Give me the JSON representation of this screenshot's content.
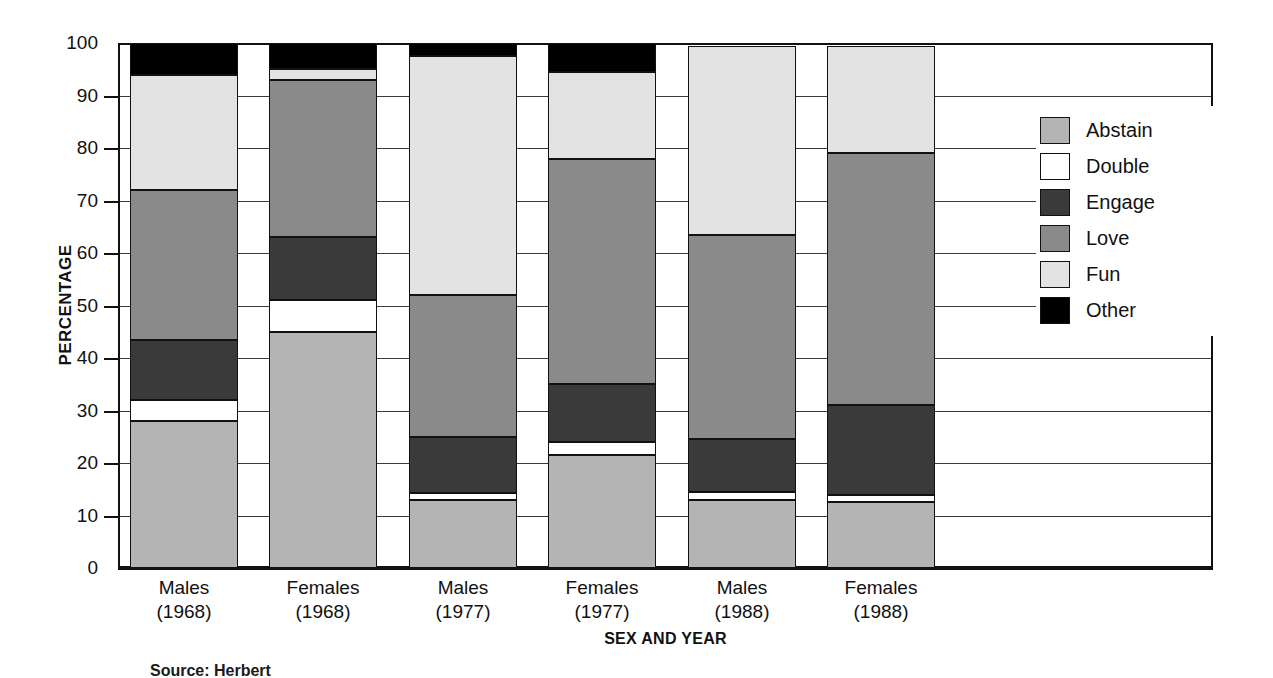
{
  "chart_data": {
    "type": "bar",
    "subtype": "stacked-bar-100",
    "title": "",
    "xlabel": "SEX AND YEAR",
    "ylabel": "PERCENTAGE",
    "ylim": [
      0,
      100
    ],
    "yticks": [
      "0",
      "10",
      "20",
      "30",
      "40",
      "50",
      "60",
      "70",
      "80",
      "90",
      "100"
    ],
    "grid": true,
    "legend_position": "right",
    "categories": [
      "Males (1968)",
      "Females (1968)",
      "Males (1977)",
      "Females (1977)",
      "Males (1988)",
      "Females (1988)"
    ],
    "category_lines": [
      {
        "line1": "Males",
        "line2": "(1968)"
      },
      {
        "line1": "Females",
        "line2": "(1968)"
      },
      {
        "line1": "Males",
        "line2": "(1977)"
      },
      {
        "line1": "Females",
        "line2": "(1977)"
      },
      {
        "line1": "Males",
        "line2": "(1988)"
      },
      {
        "line1": "Females",
        "line2": "(1988)"
      }
    ],
    "series": [
      {
        "name": "Abstain",
        "color": "#b4b4b4",
        "values": [
          28,
          45,
          13,
          21.5,
          13,
          12.5
        ]
      },
      {
        "name": "Double",
        "color": "#ffffff",
        "values": [
          4,
          6,
          1.3,
          2.5,
          1.5,
          1.5
        ]
      },
      {
        "name": "Engage",
        "color": "#3a3a3a",
        "values": [
          11.5,
          12,
          10.7,
          11,
          10,
          17
        ]
      },
      {
        "name": "Love",
        "color": "#8a8a8a",
        "values": [
          28.5,
          30,
          27,
          43,
          39,
          48
        ]
      },
      {
        "name": "Fun",
        "color": "#e3e3e3",
        "values": [
          22,
          2,
          45.5,
          16.5,
          36,
          20.5
        ]
      },
      {
        "name": "Other",
        "color": "#000000",
        "values": [
          6,
          5,
          2.5,
          5.5,
          0,
          0
        ]
      }
    ],
    "stack_tops": [
      {
        "category": "Males (1968)",
        "abstain": 28,
        "double": 32,
        "engage": 43.5,
        "love": 72,
        "fun": 94,
        "other": 100
      },
      {
        "category": "Females (1968)",
        "abstain": 45,
        "double": 51,
        "engage": 63,
        "love": 93,
        "fun": 95,
        "other": 100
      },
      {
        "category": "Males (1977)",
        "abstain": 13,
        "double": 14.3,
        "engage": 25,
        "love": 52,
        "fun": 97.5,
        "other": 100
      },
      {
        "category": "Females (1977)",
        "abstain": 21.5,
        "double": 24,
        "engage": 35,
        "love": 78,
        "fun": 94.5,
        "other": 100
      },
      {
        "category": "Males (1988)",
        "abstain": 13,
        "double": 14.5,
        "engage": 25,
        "love": 64,
        "fun": 100,
        "other": 100
      },
      {
        "category": "Females (1988)",
        "abstain": 12.5,
        "double": 14,
        "engage": 31,
        "love": 79,
        "fun": 99.5,
        "other": 99.5
      }
    ]
  },
  "axes": {
    "y_title": "PERCENTAGE",
    "x_title": "SEX AND YEAR",
    "y_ticks": [
      "100",
      "90",
      "80",
      "70",
      "60",
      "50",
      "40",
      "30",
      "20",
      "10",
      "0"
    ]
  },
  "legend": {
    "items": [
      {
        "label": "Abstain",
        "swatch": "abstain-swatch"
      },
      {
        "label": "Double",
        "swatch": "double-swatch"
      },
      {
        "label": "Engage",
        "swatch": "engage-swatch"
      },
      {
        "label": "Love",
        "swatch": "love-swatch"
      },
      {
        "label": "Fun",
        "swatch": "fun-swatch"
      },
      {
        "label": "Other",
        "swatch": "other-swatch"
      }
    ]
  },
  "footer": {
    "source": "Source: Herbert"
  }
}
